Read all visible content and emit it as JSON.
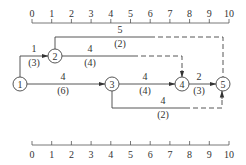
{
  "diagram": {
    "type": "time-scaled activity-on-arrow network",
    "axis_top": {
      "ticks": [
        "0",
        "1",
        "2",
        "3",
        "4",
        "5",
        "6",
        "7",
        "8",
        "9",
        "10"
      ]
    },
    "axis_bottom": {
      "ticks": [
        "0",
        "1",
        "2",
        "3",
        "4",
        "5",
        "6",
        "7",
        "8",
        "9",
        "10"
      ]
    },
    "nodes": [
      {
        "id": "1",
        "label": "1"
      },
      {
        "id": "2",
        "label": "2"
      },
      {
        "id": "3",
        "label": "3"
      },
      {
        "id": "4",
        "label": "4"
      },
      {
        "id": "5",
        "label": "5"
      }
    ],
    "edges": [
      {
        "from": "1",
        "to": "2",
        "label_top": "1",
        "label_bottom": "(3)"
      },
      {
        "from": "2",
        "to": "5",
        "label_top": "5",
        "label_bottom": "(2)"
      },
      {
        "from": "2",
        "to": "4",
        "label_top": "4",
        "label_bottom": "(4)"
      },
      {
        "from": "1",
        "to": "3",
        "label_top": "4",
        "label_bottom": "(6)"
      },
      {
        "from": "3",
        "to": "4",
        "label_top": "4",
        "label_bottom": "(4)"
      },
      {
        "from": "4",
        "to": "5",
        "label_top": "2",
        "label_bottom": "(3)"
      },
      {
        "from": "3",
        "to": "5",
        "label_top": "4",
        "label_bottom": "(2)"
      }
    ]
  }
}
